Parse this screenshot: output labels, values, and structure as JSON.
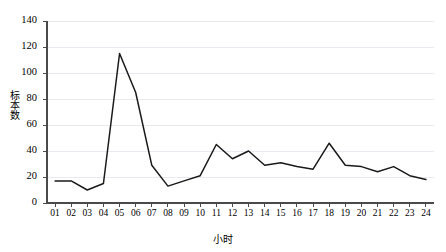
{
  "chart_data": {
    "type": "line",
    "title": "",
    "xlabel": "小时",
    "ylabel": "标本数",
    "categories": [
      "01",
      "02",
      "03",
      "04",
      "05",
      "06",
      "07",
      "08",
      "09",
      "10",
      "11",
      "12",
      "13",
      "14",
      "15",
      "16",
      "17",
      "18",
      "19",
      "20",
      "21",
      "22",
      "23",
      "24"
    ],
    "values": [
      17,
      17,
      10,
      15,
      115,
      85,
      29,
      13,
      17,
      21,
      45,
      34,
      40,
      29,
      31,
      28,
      26,
      46,
      29,
      28,
      24,
      28,
      21,
      18
    ],
    "series": [
      {
        "name": "标本数",
        "values": [
          17,
          17,
          10,
          15,
          115,
          85,
          29,
          13,
          17,
          21,
          45,
          34,
          40,
          29,
          31,
          28,
          26,
          46,
          29,
          28,
          24,
          28,
          21,
          18
        ]
      }
    ],
    "ylim": [
      0,
      140
    ],
    "yticks": [
      0,
      20,
      40,
      60,
      80,
      100,
      120,
      140
    ],
    "ytick_labels": [
      "0",
      "20",
      "40",
      "60",
      "80",
      "100",
      "120",
      "140"
    ],
    "xtick_labels": [
      "01",
      "02",
      "03",
      "04",
      "05",
      "06",
      "07",
      "08",
      "09",
      "10",
      "11",
      "12",
      "13",
      "14",
      "15",
      "16",
      "17",
      "18",
      "19",
      "20",
      "21",
      "22",
      "23",
      "24"
    ],
    "grid": true,
    "grid_axis": "y",
    "legend": false,
    "legend_position": "none",
    "line_color": "#1a1a1a",
    "grid_color": "#e9e9ef",
    "axis_color": "#4a4a4a",
    "background": "#ffffff",
    "markers": false
  }
}
